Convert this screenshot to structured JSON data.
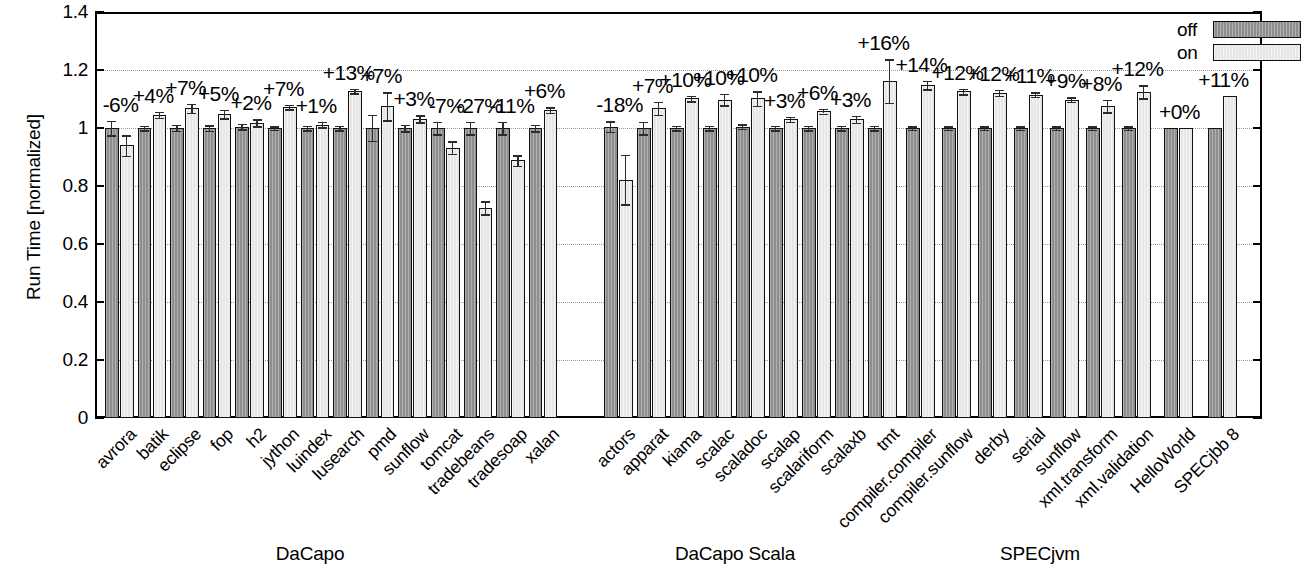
{
  "chart_data": {
    "type": "bar",
    "title": "",
    "xlabel": "",
    "ylabel": "Run Time [normalized]",
    "ylim": [
      0,
      1.4
    ],
    "yticks": [
      "0",
      "0.2",
      "0.4",
      "0.6",
      "0.8",
      "1",
      "1.2",
      "1.4"
    ],
    "ytick_values": [
      0,
      0.2,
      0.4,
      0.6,
      0.8,
      1.0,
      1.2,
      1.4
    ],
    "grid": true,
    "legend": {
      "position": "top-right",
      "entries": [
        {
          "name": "off",
          "color": "#8e8e8e"
        },
        {
          "name": "on",
          "color": "#e6e6e6"
        }
      ]
    },
    "series": [
      {
        "name": "off",
        "color": "#8e8e8e"
      },
      {
        "name": "on",
        "color": "#e6e6e6"
      }
    ],
    "groups": [
      {
        "name": "DaCapo",
        "label_x": 310,
        "benchmarks": [
          {
            "category": "avrora",
            "off": 1.0,
            "on": 0.94,
            "off_err": 0.025,
            "on_err": 0.035,
            "delta": "-6%"
          },
          {
            "category": "batik",
            "off": 1.0,
            "on": 1.045,
            "off_err": 0.008,
            "on_err": 0.01,
            "delta": "+4%"
          },
          {
            "category": "eclipse",
            "off": 1.0,
            "on": 1.068,
            "off_err": 0.01,
            "on_err": 0.016,
            "delta": "+7%"
          },
          {
            "category": "fop",
            "off": 1.0,
            "on": 1.048,
            "off_err": 0.009,
            "on_err": 0.015,
            "delta": "+5%"
          },
          {
            "category": "h2",
            "off": 1.005,
            "on": 1.018,
            "off_err": 0.01,
            "on_err": 0.012,
            "delta": "+2%"
          },
          {
            "category": "jython",
            "off": 1.0,
            "on": 1.072,
            "off_err": 0.006,
            "on_err": 0.008,
            "delta": "+7%"
          },
          {
            "category": "luindex",
            "off": 1.0,
            "on": 1.012,
            "off_err": 0.008,
            "on_err": 0.01,
            "delta": "+1%"
          },
          {
            "category": "lusearch",
            "off": 1.0,
            "on": 1.128,
            "off_err": 0.008,
            "on_err": 0.008,
            "delta": "+13%"
          },
          {
            "category": "pmd",
            "off": 1.0,
            "on": 1.075,
            "off_err": 0.045,
            "on_err": 0.048,
            "delta": "+7%"
          },
          {
            "category": "sunflow",
            "off": 1.0,
            "on": 1.032,
            "off_err": 0.012,
            "on_err": 0.012,
            "delta": "+3%"
          },
          {
            "category": "tomcat",
            "off": 1.0,
            "on": 0.932,
            "off_err": 0.022,
            "on_err": 0.022,
            "delta": "-7%"
          },
          {
            "category": "tradebeans",
            "off": 1.0,
            "on": 0.725,
            "off_err": 0.022,
            "on_err": 0.022,
            "delta": "-27%"
          },
          {
            "category": "tradesoap",
            "off": 1.0,
            "on": 0.888,
            "off_err": 0.022,
            "on_err": 0.018,
            "delta": "-11%"
          },
          {
            "category": "xalan",
            "off": 1.0,
            "on": 1.062,
            "off_err": 0.012,
            "on_err": 0.01,
            "delta": "+6%"
          }
        ]
      },
      {
        "name": "DaCapo Scala",
        "label_x": 735,
        "benchmarks": [
          {
            "category": "actors",
            "off": 1.005,
            "on": 0.822,
            "off_err": 0.018,
            "on_err": 0.085,
            "delta": "-18%"
          },
          {
            "category": "apparat",
            "off": 1.0,
            "on": 1.068,
            "off_err": 0.022,
            "on_err": 0.022,
            "delta": "+7%"
          },
          {
            "category": "kiama",
            "off": 1.0,
            "on": 1.102,
            "off_err": 0.008,
            "on_err": 0.01,
            "delta": "+10%"
          },
          {
            "category": "scalac",
            "off": 1.0,
            "on": 1.098,
            "off_err": 0.008,
            "on_err": 0.02,
            "delta": "+10%"
          },
          {
            "category": "scaladoc",
            "off": 1.005,
            "on": 1.102,
            "off_err": 0.008,
            "on_err": 0.025,
            "delta": "+10%"
          },
          {
            "category": "scalap",
            "off": 1.0,
            "on": 1.03,
            "off_err": 0.008,
            "on_err": 0.008,
            "delta": "+3%"
          },
          {
            "category": "scalariform",
            "off": 1.0,
            "on": 1.058,
            "off_err": 0.008,
            "on_err": 0.008,
            "delta": "+6%"
          },
          {
            "category": "scalaxb",
            "off": 1.0,
            "on": 1.03,
            "off_err": 0.008,
            "on_err": 0.012,
            "delta": "+3%"
          },
          {
            "category": "tmt",
            "off": 1.0,
            "on": 1.162,
            "off_err": 0.008,
            "on_err": 0.075,
            "delta": "+16%"
          }
        ]
      },
      {
        "name": "SPECjvm",
        "label_x": 1040,
        "benchmarks": [
          {
            "category": "compiler.compiler",
            "off": 1.0,
            "on": 1.148,
            "off_err": 0.006,
            "on_err": 0.014,
            "delta": "+14%"
          },
          {
            "category": "compiler.sunflow",
            "off": 1.0,
            "on": 1.126,
            "off_err": 0.006,
            "on_err": 0.01,
            "delta": "+12%"
          },
          {
            "category": "derby",
            "off": 1.0,
            "on": 1.122,
            "off_err": 0.006,
            "on_err": 0.01,
            "delta": "+12%"
          },
          {
            "category": "serial",
            "off": 1.0,
            "on": 1.115,
            "off_err": 0.006,
            "on_err": 0.008,
            "delta": "+11%"
          },
          {
            "category": "sunflow",
            "off": 1.0,
            "on": 1.098,
            "off_err": 0.006,
            "on_err": 0.008,
            "delta": "+9%"
          },
          {
            "category": "xml.transform",
            "off": 1.0,
            "on": 1.076,
            "off_err": 0.006,
            "on_err": 0.022,
            "delta": "+8%"
          },
          {
            "category": "xml.validation",
            "off": 1.0,
            "on": 1.125,
            "off_err": 0.006,
            "on_err": 0.022,
            "delta": "+12%"
          }
        ]
      },
      {
        "name": "",
        "label_x": 0,
        "benchmarks": [
          {
            "category": "HelloWorld",
            "off": 1.0,
            "on": 1.0,
            "off_err": 0.0,
            "on_err": 0.0,
            "delta": "+0%"
          },
          {
            "category": "SPECjbb 8",
            "off": 1.0,
            "on": 1.112,
            "off_err": 0.0,
            "on_err": 0.0,
            "delta": "+11%"
          }
        ]
      }
    ]
  },
  "layout": {
    "plot": {
      "left": 95,
      "top": 12,
      "width": 1167,
      "height": 406
    },
    "y_top_value": 1.4,
    "group_starts": [
      105,
      604,
      906,
      1164
    ],
    "bar_pitch": [
      32.6,
      33.0,
      36.0,
      44.0
    ],
    "bar_width": 13.5
  }
}
